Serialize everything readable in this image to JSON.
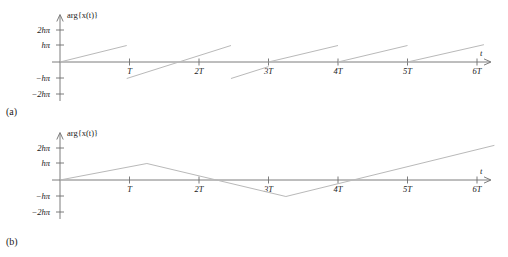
{
  "figure": {
    "panels": [
      {
        "id": "a",
        "panel_label": "(a)",
        "y_axis_title": "arg{x(t)}",
        "x_axis_title": "t",
        "y_ticks": [
          "2hπ",
          "hπ",
          "−hπ",
          "−2hπ"
        ],
        "x_ticks": [
          "T",
          "2T",
          "3T",
          "4T",
          "5T",
          "6T"
        ]
      },
      {
        "id": "b",
        "panel_label": "(b)",
        "y_axis_title": "arg{x(t)}",
        "x_axis_title": "t",
        "y_ticks": [
          "2hπ",
          "hπ",
          "−hπ",
          "−2hπ"
        ],
        "x_ticks": [
          "T",
          "2T",
          "3T",
          "4T",
          "5T",
          "6T"
        ]
      }
    ],
    "colors": {
      "curve": "#b9b9b9",
      "axis": "#6e6e6e",
      "text": "#1a1a1a",
      "background": "#ffffff"
    }
  },
  "chart_data": [
    {
      "type": "line",
      "id": "panel-a",
      "title": "",
      "xlabel": "t",
      "ylabel": "arg{x(t)}",
      "description": "Wrapped (sawtooth) phase of x(t): linear ramps that jump by 2h-pi whenever the phase exceeds h-pi.",
      "xlim": [
        0,
        6.4
      ],
      "ylim": [
        -2.3,
        2.3
      ],
      "x_tick_values": [
        1,
        2,
        3,
        4,
        5,
        6
      ],
      "x_tick_labels": [
        "T",
        "2T",
        "3T",
        "4T",
        "5T",
        "6T"
      ],
      "y_tick_values": [
        2,
        1,
        -1,
        -2
      ],
      "y_tick_labels": [
        "2hπ",
        "hπ",
        "−hπ",
        "−2hπ"
      ],
      "grid": false,
      "legend": false,
      "series": [
        {
          "name": "wrapped-phase",
          "color": "#b9b9b9",
          "segments": [
            {
              "x": [
                0.0,
                0.96
              ],
              "y": [
                0.0,
                1.0
              ]
            },
            {
              "x": [
                0.96,
                2.46
              ],
              "y": [
                -1.0,
                1.0
              ]
            },
            {
              "x": [
                2.46,
                3.0
              ],
              "y": [
                -1.0,
                -0.28
              ]
            },
            {
              "x": [
                3.0,
                4.0
              ],
              "y": [
                0.0,
                1.0
              ]
            },
            {
              "x": [
                4.0,
                5.0
              ],
              "y": [
                0.0,
                1.0
              ]
            },
            {
              "x": [
                5.0,
                6.1
              ],
              "y": [
                0.0,
                1.05
              ]
            }
          ]
        }
      ]
    },
    {
      "type": "line",
      "id": "panel-b",
      "title": "",
      "xlabel": "t",
      "ylabel": "arg{x(t)}",
      "description": "Unwrapped / continuous phase of x(t): a triangular waveform rising to h-pi, falling to -h-pi and rising again past 2h-pi.",
      "xlim": [
        0,
        6.4
      ],
      "ylim": [
        -2.3,
        2.3
      ],
      "x_tick_values": [
        1,
        2,
        3,
        4,
        5,
        6
      ],
      "x_tick_labels": [
        "T",
        "2T",
        "3T",
        "4T",
        "5T",
        "6T"
      ],
      "y_tick_values": [
        2,
        1,
        -1,
        -2
      ],
      "y_tick_labels": [
        "2hπ",
        "hπ",
        "−hπ",
        "−2hπ"
      ],
      "grid": false,
      "legend": false,
      "series": [
        {
          "name": "unwrapped-phase",
          "color": "#b9b9b9",
          "vertices": {
            "x": [
              0.0,
              1.25,
              3.25,
              6.25
            ],
            "y": [
              0.0,
              1.0,
              -1.0,
              2.1
            ]
          }
        }
      ]
    }
  ]
}
